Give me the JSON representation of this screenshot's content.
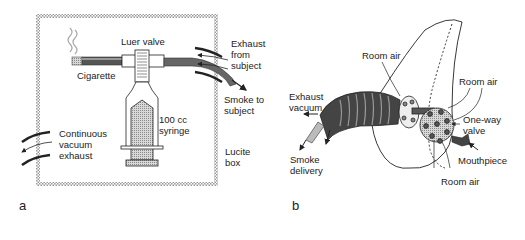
{
  "figure": {
    "panel_a": {
      "letter": "a",
      "labels": {
        "luer_valve": "Luer valve",
        "cigarette": "Cigarette",
        "exhaust_from_subject": "Exhaust\nfrom\nsubject",
        "smoke_to_subject": "Smoke to\nsubject",
        "syringe": "100 cc\nsyringe",
        "vacuum_exhaust": "Continuous\nvacuum\nexhaust",
        "lucite_box": "Lucite\nbox"
      }
    },
    "panel_b": {
      "letter": "b",
      "labels": {
        "room_air_top": "Room air",
        "room_air_right": "Room air",
        "room_air_bottom": "Room air",
        "exhaust_vacuum": "Exhaust\nvacuum",
        "smoke_delivery": "Smoke\ndelivery",
        "one_way_valve": "One-way\nvalve",
        "mouthpiece": "Mouthpiece"
      }
    }
  }
}
